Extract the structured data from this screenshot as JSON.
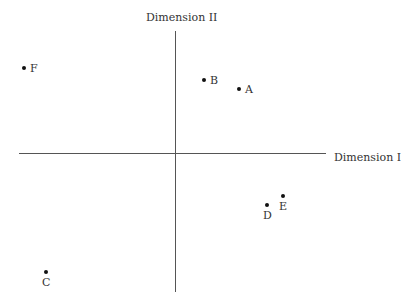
{
  "chart_data": {
    "type": "scatter",
    "title": "",
    "xlabel": "Dimension I",
    "ylabel": "Dimension II",
    "grid": false,
    "legend": null,
    "origin_px": [
      175,
      153
    ],
    "scale_px_per_unit": 10,
    "points": [
      {
        "label": "A",
        "x": 6.4,
        "y": 6.4,
        "label_pos": "right"
      },
      {
        "label": "B",
        "x": 2.9,
        "y": 7.3,
        "label_pos": "right"
      },
      {
        "label": "C",
        "x": -12.9,
        "y": -11.9,
        "label_pos": "below"
      },
      {
        "label": "D",
        "x": 9.2,
        "y": -5.2,
        "label_pos": "below"
      },
      {
        "label": "E",
        "x": 10.8,
        "y": -4.3,
        "label_pos": "below"
      },
      {
        "label": "F",
        "x": -15.1,
        "y": 8.5,
        "label_pos": "right"
      }
    ],
    "xlim": [
      -15.6,
      15.1
    ],
    "ylim": [
      -13.9,
      12.2
    ]
  }
}
